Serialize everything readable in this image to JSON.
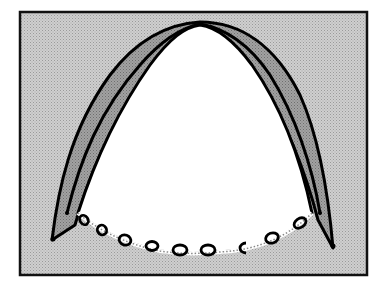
{
  "diagram": {
    "type": "anatomical-illustration",
    "colors": {
      "background_fill": "#c4c4c4",
      "outer_band_fill": "#9a9a9a",
      "inner_band_fill": "#8e8e8e",
      "interior_fill": "#ffffff",
      "outline": "#000000",
      "frame": "#111111"
    },
    "frame": {
      "x": 20,
      "y": 12,
      "width": 347,
      "height": 263
    },
    "ring_count": 10
  }
}
